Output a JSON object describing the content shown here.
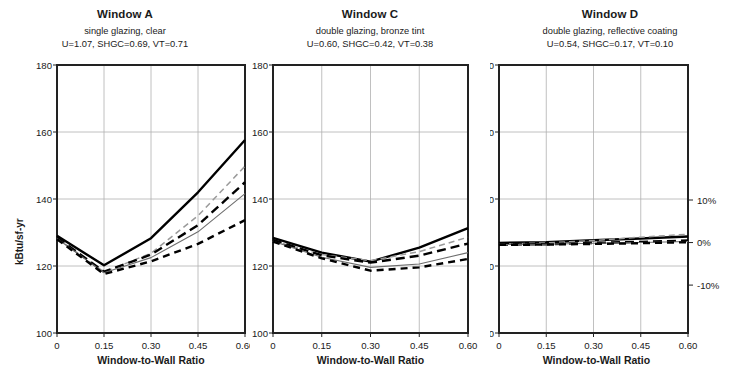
{
  "figure": {
    "width": 730,
    "height": 391,
    "background": "#ffffff",
    "footnote": ""
  },
  "axis_common": {
    "ylabel": "kBtu/sf-yr",
    "xlabel": "Window-to-Wall Ratio",
    "ytick_labels": [
      "180",
      "160",
      "140",
      "120",
      "100"
    ],
    "xtick_labels": [
      "0",
      "0.15",
      "0.30",
      "0.45",
      "0.60"
    ],
    "pct_tick_labels": [
      "10%",
      "0%",
      "-10%"
    ]
  },
  "chart_data": [
    {
      "id": "window-a",
      "type": "line",
      "title": "Window A",
      "subtitle": "single glazing, clear",
      "properties": "U=1.07, SHGC=0.69, VT=0.71",
      "xlabel": "Window-to-Wall Ratio",
      "ylabel": "kBtu/sf-yr",
      "x": [
        0,
        0.15,
        0.3,
        0.45,
        0.6
      ],
      "xlim": [
        0,
        0.6
      ],
      "ylim": [
        100,
        180
      ],
      "yticks": [
        100,
        120,
        140,
        160,
        180
      ],
      "xticks": [
        0,
        0.15,
        0.3,
        0.45,
        0.6
      ],
      "grid": true,
      "legend": "none",
      "series": [
        {
          "name": "s1",
          "style": "solid-thick",
          "values": [
            129.0,
            120.2,
            128.3,
            142.0,
            157.6
          ]
        },
        {
          "name": "s2",
          "style": "dashed-thin",
          "values": [
            128.3,
            118.2,
            123.8,
            135.0,
            149.8
          ]
        },
        {
          "name": "s3",
          "style": "longdash-thick",
          "values": [
            128.5,
            118.3,
            123.4,
            132.2,
            145.0
          ]
        },
        {
          "name": "s4",
          "style": "solid-thin",
          "values": [
            128.2,
            118.0,
            122.5,
            130.2,
            141.6
          ]
        },
        {
          "name": "s5",
          "style": "dashed-thick",
          "values": [
            128.0,
            117.6,
            121.4,
            126.6,
            133.7
          ]
        }
      ]
    },
    {
      "id": "window-c",
      "type": "line",
      "title": "Window C",
      "subtitle": "double glazing, bronze tint",
      "properties": "U=0.60, SHGC=0.42, VT=0.38",
      "xlabel": "Window-to-Wall Ratio",
      "ylabel": "kBtu/sf-yr",
      "x": [
        0,
        0.15,
        0.3,
        0.45,
        0.6
      ],
      "xlim": [
        0,
        0.6
      ],
      "ylim": [
        100,
        180
      ],
      "yticks": [
        100,
        120,
        140,
        160,
        180
      ],
      "xticks": [
        0,
        0.15,
        0.3,
        0.45,
        0.6
      ],
      "grid": true,
      "legend": "none",
      "series": [
        {
          "name": "s1",
          "style": "solid-thick",
          "values": [
            128.4,
            124.0,
            121.3,
            125.5,
            131.3
          ]
        },
        {
          "name": "s2",
          "style": "dashed-thin",
          "values": [
            127.5,
            123.4,
            121.6,
            124.3,
            128.6
          ]
        },
        {
          "name": "s3",
          "style": "longdash-thick",
          "values": [
            127.8,
            123.2,
            121.0,
            123.1,
            126.7
          ]
        },
        {
          "name": "s4",
          "style": "solid-thin",
          "values": [
            127.4,
            122.6,
            119.6,
            120.6,
            124.0
          ]
        },
        {
          "name": "s5",
          "style": "dashed-thick",
          "values": [
            127.3,
            122.3,
            118.6,
            119.6,
            122.1
          ]
        }
      ]
    },
    {
      "id": "window-d",
      "type": "line",
      "title": "Window D",
      "subtitle": "double glazing, reflective coating",
      "properties": "U=0.54, SHGC=0.17, VT=0.10",
      "xlabel": "Window-to-Wall Ratio",
      "ylabel": "kBtu/sf-yr",
      "x": [
        0,
        0.15,
        0.3,
        0.45,
        0.6
      ],
      "xlim": [
        0,
        0.6
      ],
      "ylim": [
        100,
        180
      ],
      "yticks": [
        100,
        120,
        140,
        160,
        180
      ],
      "xticks": [
        0,
        0.15,
        0.3,
        0.45,
        0.6
      ],
      "grid": true,
      "legend": "none",
      "right_axis": {
        "label": "percent difference",
        "ticks": [
          10,
          0,
          -10
        ],
        "tick_labels": [
          "10%",
          "0%",
          "-10%"
        ],
        "baseline_value": 127.0,
        "percent_per_unit": 12.7
      },
      "series": [
        {
          "name": "s1",
          "style": "solid-thick",
          "values": [
            126.9,
            127.1,
            127.7,
            128.2,
            128.8
          ]
        },
        {
          "name": "s2",
          "style": "dashed-thin",
          "values": [
            126.5,
            126.9,
            127.6,
            128.6,
            129.5
          ]
        },
        {
          "name": "s3",
          "style": "longdash-thick",
          "values": [
            126.4,
            126.5,
            126.9,
            127.2,
            127.6
          ]
        },
        {
          "name": "s4",
          "style": "solid-thin",
          "values": [
            126.4,
            126.5,
            126.8,
            127.0,
            127.3
          ]
        },
        {
          "name": "s5",
          "style": "dashed-thick",
          "values": [
            126.3,
            126.4,
            126.6,
            126.8,
            127.1
          ]
        }
      ]
    }
  ],
  "style_map": {
    "solid-thick": {
      "color": "#000000",
      "width": 2.4,
      "dash": ""
    },
    "dashed-thin": {
      "color": "#9a9a9a",
      "width": 1.5,
      "dash": "6,4"
    },
    "longdash-thick": {
      "color": "#000000",
      "width": 2.4,
      "dash": "9,5"
    },
    "solid-thin": {
      "color": "#6e6e6e",
      "width": 1.1,
      "dash": ""
    },
    "dashed-thick": {
      "color": "#000000",
      "width": 2.4,
      "dash": "7,5"
    }
  }
}
